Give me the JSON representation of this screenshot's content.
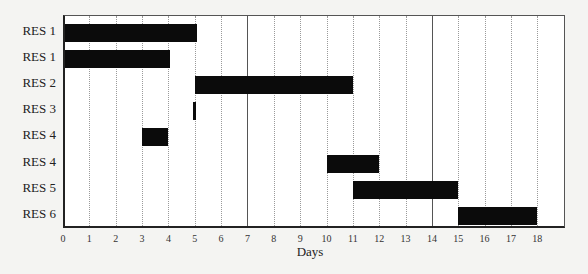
{
  "chart_data": {
    "type": "gantt",
    "title": "",
    "xlabel": "Days",
    "ylabel": "",
    "xlim": [
      0,
      19
    ],
    "x_ticks": [
      0,
      1,
      2,
      3,
      4,
      5,
      6,
      7,
      8,
      9,
      10,
      11,
      12,
      13,
      14,
      15,
      16,
      17,
      18
    ],
    "grid": {
      "vertical_dotted": true,
      "major_solid_at": [
        7,
        14
      ]
    },
    "rows": [
      {
        "label": "RES 1",
        "start": 0,
        "end": 5
      },
      {
        "label": "RES 1",
        "start": 0,
        "end": 4
      },
      {
        "label": "RES 2",
        "start": 5,
        "end": 11
      },
      {
        "label": "RES 3",
        "start": 4.95,
        "end": 5.05
      },
      {
        "label": "RES 4",
        "start": 3,
        "end": 4
      },
      {
        "label": "RES 4",
        "start": 10,
        "end": 12
      },
      {
        "label": "RES 5",
        "start": 11,
        "end": 15
      },
      {
        "label": "RES 6",
        "start": 15,
        "end": 18
      }
    ],
    "bar_color": "#0b0b0b"
  }
}
